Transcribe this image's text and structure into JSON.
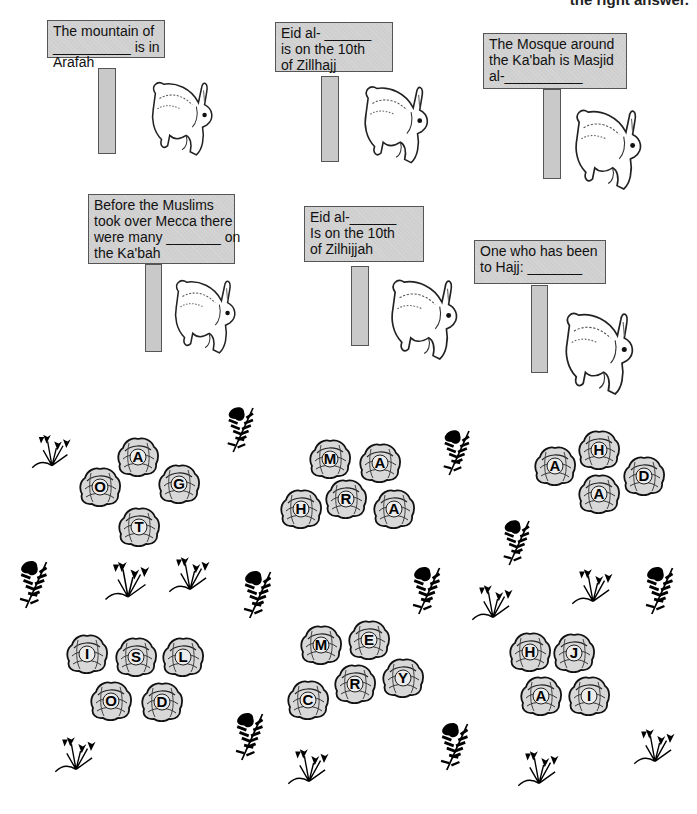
{
  "header": {
    "instruction": "the right answer."
  },
  "signs": [
    {
      "lines": [
        "The mountain of",
        "__________ is in",
        "Arafah"
      ]
    },
    {
      "lines": [
        "Eid al- ______",
        "is on the 10th",
        "of Zillhajj"
      ]
    },
    {
      "lines": [
        "The Mosque around",
        "the Ka'bah is Masjid",
        "al-__________"
      ]
    },
    {
      "lines": [
        "Before the Muslims",
        "took over Mecca there",
        "were many _______ on",
        "the Ka'bah"
      ]
    },
    {
      "lines": [
        "Eid al-______",
        "Is on the 10th",
        "of Zilhijjah"
      ]
    },
    {
      "lines": [
        "One who has been",
        "to Hajj:  _______"
      ]
    }
  ],
  "cabbage_groups": [
    {
      "letters": [
        "A",
        "O",
        "G",
        "T"
      ]
    },
    {
      "letters": [
        "M",
        "A",
        "H",
        "R",
        "A"
      ]
    },
    {
      "letters": [
        "H",
        "A",
        "D",
        "A"
      ]
    },
    {
      "letters": [
        "I",
        "S",
        "L",
        "O",
        "D"
      ]
    },
    {
      "letters": [
        "M",
        "E",
        "C",
        "R",
        "Y"
      ]
    },
    {
      "letters": [
        "H",
        "J",
        "A",
        "I"
      ]
    }
  ],
  "colors": {
    "sign_fill": "#cfcfcf",
    "ink": "#111111",
    "background": "#ffffff"
  }
}
